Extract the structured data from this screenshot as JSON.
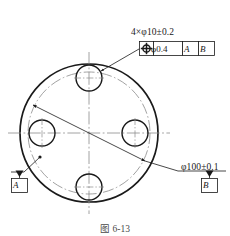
{
  "figure": {
    "caption": "图 6-13"
  },
  "annotations": {
    "hole_callout": "4×φ10±0.2",
    "diameter_dimension": "φ100±0.1",
    "feature_control_frame": {
      "symbol": "position-symbol",
      "tolerance": "φ0.4",
      "datum_primary": "A",
      "datum_secondary": "B"
    },
    "datum_a": "A",
    "datum_b": "B"
  },
  "geometry": {
    "center": {
      "x": 89,
      "y": 133
    },
    "outer_circle_radius": 69,
    "bolt_circle_radius": 61,
    "hole_radius": 13,
    "hole_count": 4,
    "hole_angles_deg": [
      90,
      180,
      270,
      0
    ],
    "holes": [
      {
        "name": "hole-top",
        "cx": 89,
        "cy": 78
      },
      {
        "name": "hole-left",
        "cx": 42,
        "cy": 133
      },
      {
        "name": "hole-bottom",
        "cx": 89,
        "cy": 187
      },
      {
        "name": "hole-right",
        "cx": 135,
        "cy": 133
      }
    ]
  },
  "colors": {
    "line": "#1a1a1a",
    "thin_line": "#6b6b6b",
    "center_line": "#8a8a8a",
    "background": "#ffffff"
  }
}
